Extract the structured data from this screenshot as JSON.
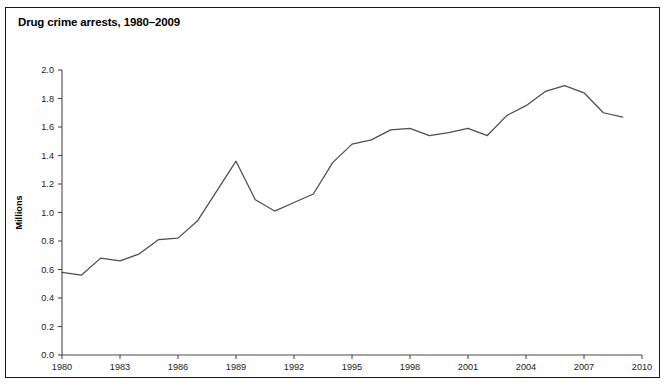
{
  "figure": {
    "title": "Drug crime arrests, 1980–2009",
    "frame_color": "#1a1a1a",
    "background": "#ffffff"
  },
  "chart_data": {
    "type": "line",
    "title": "Drug crime arrests, 1980–2009",
    "xlabel": "",
    "ylabel": "Millions",
    "xlim": [
      1980,
      2010
    ],
    "ylim": [
      0.0,
      2.0
    ],
    "grid": false,
    "legend": false,
    "line_color": "#4d4d52",
    "x_ticks": [
      1980,
      1983,
      1986,
      1989,
      1992,
      1995,
      1998,
      2001,
      2004,
      2007,
      2010
    ],
    "x_tick_labels": [
      "1980",
      "1983",
      "1986",
      "1989",
      "1992",
      "1995",
      "1998",
      "2001",
      "2004",
      "2007",
      "2010"
    ],
    "y_ticks": [
      0.0,
      0.2,
      0.4,
      0.6,
      0.8,
      1.0,
      1.2,
      1.4,
      1.6,
      1.8,
      2.0
    ],
    "y_tick_labels": [
      "0.0",
      "0.2",
      "0.4",
      "0.6",
      "0.8",
      "1.0",
      "1.2",
      "1.4",
      "1.6",
      "1.8",
      "2.0"
    ],
    "x": [
      1980,
      1981,
      1982,
      1983,
      1984,
      1985,
      1986,
      1987,
      1988,
      1989,
      1990,
      1991,
      1992,
      1993,
      1994,
      1995,
      1996,
      1997,
      1998,
      1999,
      2000,
      2001,
      2002,
      2003,
      2004,
      2005,
      2006,
      2007,
      2008,
      2009
    ],
    "values": [
      0.58,
      0.56,
      0.68,
      0.66,
      0.71,
      0.81,
      0.82,
      0.94,
      1.15,
      1.36,
      1.09,
      1.01,
      1.07,
      1.13,
      1.35,
      1.48,
      1.51,
      1.58,
      1.59,
      1.54,
      1.56,
      1.59,
      1.54,
      1.68,
      1.75,
      1.85,
      1.89,
      1.84,
      1.7,
      1.67
    ],
    "series": [
      {
        "name": "Drug crime arrests",
        "values": [
          0.58,
          0.56,
          0.68,
          0.66,
          0.71,
          0.81,
          0.82,
          0.94,
          1.15,
          1.36,
          1.09,
          1.01,
          1.07,
          1.13,
          1.35,
          1.48,
          1.51,
          1.58,
          1.59,
          1.54,
          1.56,
          1.59,
          1.54,
          1.68,
          1.75,
          1.85,
          1.89,
          1.84,
          1.7,
          1.67
        ]
      }
    ]
  }
}
